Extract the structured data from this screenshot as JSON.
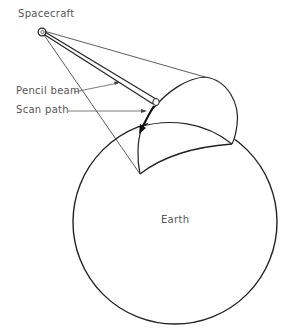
{
  "diagram": {
    "labels": {
      "spacecraft": "Spacecraft",
      "pencil_beam": "Pencil beam",
      "scan_path": "Scan path",
      "earth": "Earth"
    },
    "colors": {
      "line": "#222222",
      "text": "#555555",
      "background": "#ffffff"
    }
  }
}
